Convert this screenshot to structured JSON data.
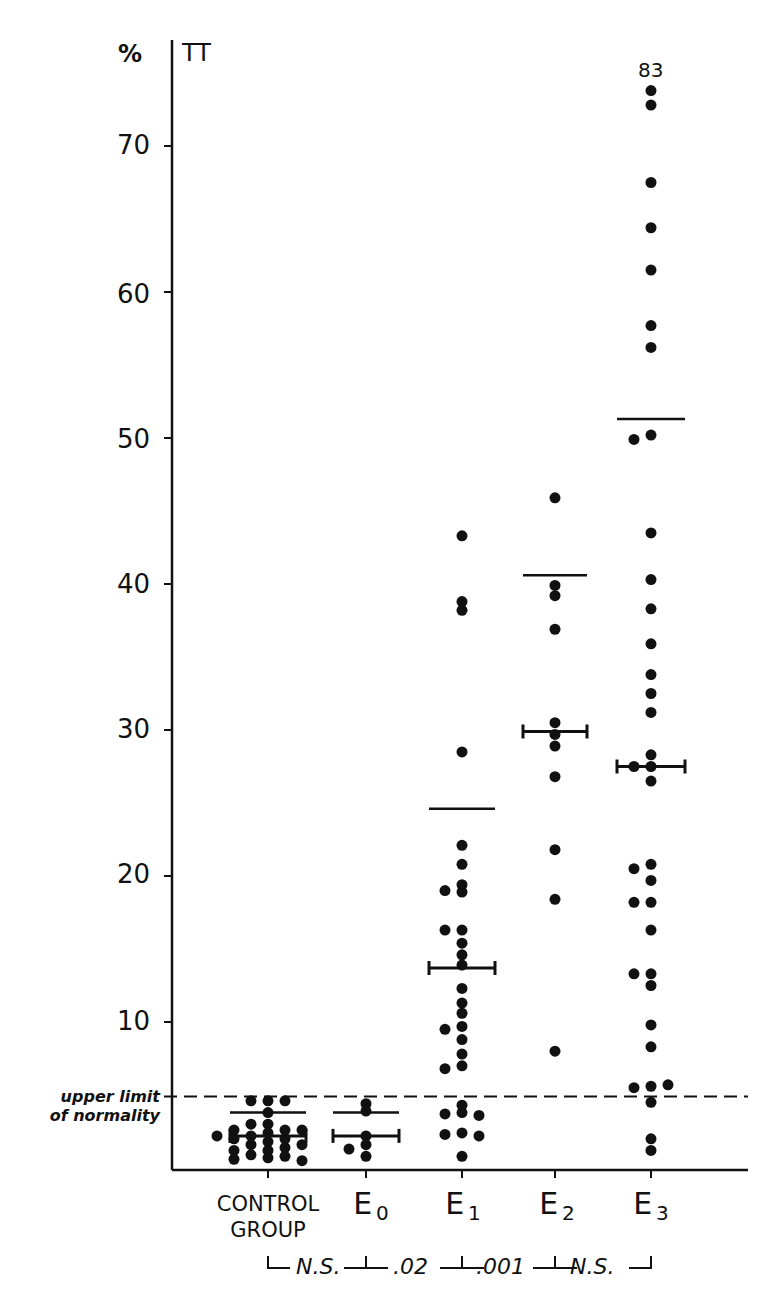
{
  "chart_data": {
    "type": "scatter",
    "title": "",
    "series_label": "TT",
    "ylabel": "%",
    "xlabel": "",
    "ylim": [
      0,
      76
    ],
    "yticks": [
      10,
      20,
      30,
      40,
      50,
      60,
      70
    ],
    "grid": false,
    "categories": [
      "CONTROL GROUP",
      "E0",
      "E1",
      "E2",
      "E3"
    ],
    "category_display": [
      {
        "main": "CONTROL",
        "line2": "GROUP",
        "sub": ""
      },
      {
        "main": "E",
        "line2": "",
        "sub": "0"
      },
      {
        "main": "E",
        "line2": "",
        "sub": "1"
      },
      {
        "main": "E",
        "line2": "",
        "sub": "2"
      },
      {
        "main": "E",
        "line2": "",
        "sub": "3"
      }
    ],
    "reference_line": {
      "value": 4.9,
      "label_line1": "upper limit",
      "label_line2": "of normality",
      "style": "dashed"
    },
    "annotations": [
      {
        "text": "83",
        "category": "E3",
        "note": "off-scale value above axis top"
      }
    ],
    "significance": [
      {
        "between": [
          "CONTROL GROUP",
          "E0"
        ],
        "label": "N.S."
      },
      {
        "between": [
          "E0",
          "E1"
        ],
        "label": ".02"
      },
      {
        "between": [
          "E1",
          "E2"
        ],
        "label": ".001"
      },
      {
        "between": [
          "E2",
          "E3"
        ],
        "label": "N.S."
      }
    ],
    "groups": [
      {
        "name": "CONTROL GROUP",
        "mean": 2.2,
        "upper_line": 3.8,
        "values": [
          4.6,
          4.6,
          4.6,
          3.8,
          3.0,
          3.0,
          2.6,
          2.6,
          2.6,
          2.4,
          2.2,
          2.2,
          2.0,
          2.0,
          1.8,
          1.6,
          1.6,
          1.4,
          1.2,
          1.2,
          0.9,
          0.8,
          0.7,
          0.6,
          0.5
        ]
      },
      {
        "name": "E0",
        "mean": 2.2,
        "upper_line": 3.8,
        "values": [
          4.4,
          3.9,
          2.2,
          1.6,
          1.3,
          0.8
        ]
      },
      {
        "name": "E1",
        "mean": 13.7,
        "upper_line": 24.6,
        "values": [
          43.3,
          38.8,
          38.2,
          28.5,
          22.1,
          20.8,
          19.4,
          19.0,
          18.9,
          16.3,
          16.3,
          15.4,
          14.6,
          13.9,
          12.3,
          11.3,
          10.6,
          9.7,
          9.5,
          8.8,
          7.8,
          7.0,
          6.8,
          4.3,
          3.8,
          3.7,
          3.6,
          2.4,
          2.3,
          2.2,
          0.8
        ]
      },
      {
        "name": "E2",
        "mean": 29.9,
        "upper_line": 40.6,
        "values": [
          45.9,
          39.9,
          39.2,
          36.9,
          30.5,
          29.7,
          28.9,
          26.8,
          21.8,
          18.4,
          8.0
        ]
      },
      {
        "name": "E3",
        "mean": 27.5,
        "upper_line": 51.3,
        "values": [
          83,
          73.8,
          72.8,
          67.5,
          64.4,
          61.5,
          57.7,
          56.2,
          50.2,
          49.9,
          43.5,
          40.3,
          38.3,
          35.9,
          33.8,
          32.5,
          31.2,
          28.3,
          27.5,
          27.5,
          26.5,
          20.8,
          20.5,
          19.7,
          18.2,
          18.2,
          16.3,
          13.3,
          13.3,
          12.5,
          9.8,
          8.3,
          5.6,
          5.5,
          5.7,
          4.5,
          2.0,
          1.2
        ]
      }
    ]
  },
  "axis": {
    "unit_label": "%",
    "series_label": "TT",
    "tick_labels": [
      "70",
      "60",
      "50",
      "40",
      "30",
      "20",
      "10"
    ],
    "top_annotation": "83",
    "limit_line1": "upper limit",
    "limit_line2": "of normality"
  },
  "xaxis": {
    "control_line1": "CONTROL",
    "control_line2": "GROUP",
    "e_letter": "E",
    "e_subs": [
      "0",
      "1",
      "2",
      "3"
    ],
    "sig": [
      "N.S.",
      ".02",
      ".001",
      "N.S."
    ]
  },
  "colors": {
    "ink": "#111111",
    "background": "#ffffff"
  }
}
